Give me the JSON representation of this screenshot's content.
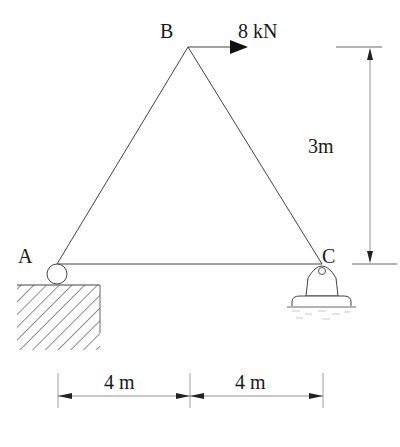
{
  "diagram": {
    "type": "truss",
    "nodes": [
      {
        "id": "A",
        "label": "A",
        "support": "roller"
      },
      {
        "id": "B",
        "label": "B"
      },
      {
        "id": "C",
        "label": "C",
        "support": "pin"
      }
    ],
    "members": [
      [
        "A",
        "B"
      ],
      [
        "B",
        "C"
      ],
      [
        "A",
        "C"
      ]
    ],
    "load": {
      "node": "B",
      "label": "8 kN",
      "direction": "right"
    },
    "dimensions": {
      "height": "3m",
      "span_left": "4 m",
      "span_right": "4 m"
    }
  },
  "colors": {
    "line": "#333333",
    "background": "#ffffff"
  }
}
